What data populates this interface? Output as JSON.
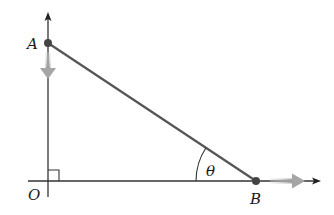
{
  "diagram": {
    "type": "geometry-figure",
    "labels": {
      "point_a": "A",
      "point_b": "B",
      "origin": "O",
      "angle": "θ"
    },
    "elements": {
      "vertical_axis": {
        "x": 48,
        "y_top": 13,
        "y_bottom": 197
      },
      "horizontal_axis": {
        "y": 181,
        "x_left": 28,
        "x_right": 320
      },
      "point_a": {
        "x": 48,
        "y": 43
      },
      "point_b": {
        "x": 256,
        "y": 181
      },
      "segment_ab": {
        "from": "A",
        "to": "B"
      },
      "right_angle_marker": {
        "at": "O",
        "size": 11
      },
      "angle_arc": {
        "at": "B",
        "symbol": "θ"
      },
      "velocity_arrow_a": {
        "direction": "down",
        "color": "#aaaaaa"
      },
      "velocity_arrow_b": {
        "direction": "right",
        "color": "#aaaaaa"
      }
    },
    "colors": {
      "line": "#555555",
      "axis": "#333333",
      "point": "#444444",
      "motion_arrow": "#b0b0b0"
    }
  }
}
